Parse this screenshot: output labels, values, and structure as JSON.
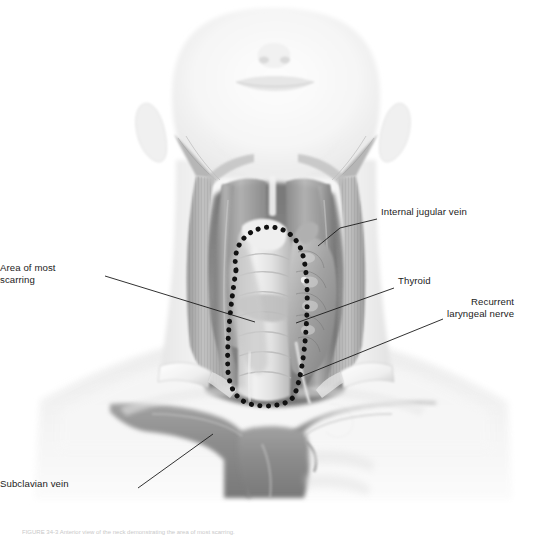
{
  "figure": {
    "domain": "medical-anatomical-illustration",
    "view": "anterior neck, inferior oblique view",
    "rendering": "grayscale halftone airbrush illustration",
    "background_color": "#ffffff",
    "ink_color": "#1b1b1b",
    "caption": "FIGURE 34-3  Anterior view of the neck demonstrating the area of most scarring."
  },
  "labels": [
    {
      "id": "internal-jugular-vein",
      "text": "Internal jugular vein",
      "align": "left",
      "text_x": 381,
      "text_y": 212,
      "leader": [
        [
          377,
          219
        ],
        [
          340,
          228
        ],
        [
          318,
          246
        ]
      ]
    },
    {
      "id": "thyroid",
      "text": "Thyroid",
      "align": "left",
      "text_x": 398,
      "text_y": 281,
      "leader": [
        [
          394,
          288
        ],
        [
          296,
          323
        ]
      ]
    },
    {
      "id": "recurrent-laryngeal-nerve",
      "text": "Recurrent\nlaryngeal nerve",
      "align": "left",
      "text_x": 447,
      "text_y": 301,
      "leader": [
        [
          443,
          319
        ],
        [
          300,
          377
        ]
      ]
    },
    {
      "id": "area-of-most-scarring",
      "text": "Area of most\nscarring",
      "align": "right",
      "text_x": 35,
      "text_y": 268,
      "leader": [
        [
          105,
          276
        ],
        [
          255,
          322
        ]
      ]
    },
    {
      "id": "subclavian-vein",
      "text": "Subclavian vein",
      "align": "right",
      "text_x": 52,
      "text_y": 484,
      "leader": [
        [
          138,
          488
        ],
        [
          213,
          434
        ]
      ]
    }
  ],
  "scarring_outline": {
    "style": "dotted",
    "dot_color": "#111111",
    "dot_radius": 2.5,
    "dot_spacing": 8.4,
    "description": "teardrop / oval dotted boundary over the anterior midline dissection field"
  },
  "anatomy": {
    "structures": [
      "head (chin, nose, mouth, ears)",
      "sternocleidomastoid muscles",
      "strap muscles (sternohyoid, sternothyroid)",
      "thyroid gland lobes and isthmus",
      "trachea",
      "internal jugular veins",
      "subclavian veins",
      "brachiocephalic / innominate vein",
      "recurrent laryngeal nerve",
      "clavicles and shoulders",
      "retractors"
    ]
  }
}
